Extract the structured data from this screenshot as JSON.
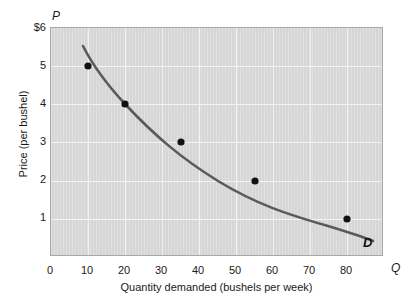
{
  "chart_data": {
    "type": "line",
    "title": "",
    "subtitle": "",
    "xlabel": "Quantity demanded (bushels per week)",
    "ylabel": "Price (per bushel)",
    "x_axis_symbol": "Q",
    "y_axis_symbol": "P",
    "xlim": [
      0,
      90
    ],
    "ylim": [
      0,
      6
    ],
    "grid": true,
    "legend_position": "inline-curve-end",
    "x_ticks": [
      {
        "value": 0,
        "label": "0"
      },
      {
        "value": 10,
        "label": "10"
      },
      {
        "value": 20,
        "label": "20"
      },
      {
        "value": 30,
        "label": "30"
      },
      {
        "value": 40,
        "label": "40"
      },
      {
        "value": 50,
        "label": "50"
      },
      {
        "value": 60,
        "label": "60"
      },
      {
        "value": 70,
        "label": "70"
      },
      {
        "value": 80,
        "label": "80"
      }
    ],
    "y_ticks": [
      {
        "value": 6,
        "label": "$6"
      },
      {
        "value": 5,
        "label": "5"
      },
      {
        "value": 4,
        "label": "4"
      },
      {
        "value": 3,
        "label": "3"
      },
      {
        "value": 2,
        "label": "2"
      },
      {
        "value": 1,
        "label": "1"
      }
    ],
    "series": [
      {
        "name": "D",
        "annotation": "D",
        "description": "Demand curve",
        "color": "#5a5a5a",
        "x": [
          10,
          20,
          35,
          55,
          80
        ],
        "y": [
          5,
          4,
          3,
          2,
          1
        ],
        "points": [
          {
            "quantity": 10,
            "price": 5
          },
          {
            "quantity": 20,
            "price": 4
          },
          {
            "quantity": 35,
            "price": 3
          },
          {
            "quantity": 55,
            "price": 2
          },
          {
            "quantity": 80,
            "price": 1
          }
        ],
        "marker_color": "#111111"
      }
    ],
    "colors": {
      "plot_background": "#d6d6d6",
      "gridline": "#f2f2f2",
      "curve": "#5a5a5a",
      "marker": "#111111",
      "text": "#1a1a1a",
      "page_background": "#ffffff",
      "plot_border": "#a8a8a8"
    }
  }
}
